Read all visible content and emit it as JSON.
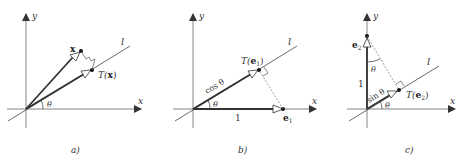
{
  "panels": [
    {
      "id": "a",
      "caption": "a)",
      "labels": {
        "x_axis": "x",
        "y_axis": "y",
        "line": "l",
        "angle": "θ",
        "vector": "x",
        "image_prefix": "T(",
        "image_arg": "x",
        "image_suffix": ")"
      }
    },
    {
      "id": "b",
      "caption": "b)",
      "labels": {
        "x_axis": "x",
        "y_axis": "y",
        "line": "l",
        "angle": "θ",
        "proj_length": "cos θ",
        "unit_length": "1",
        "vector": "e",
        "vector_sub": "1",
        "image_prefix": "T(",
        "image_arg": "e",
        "image_sub": "1",
        "image_suffix": ")"
      }
    },
    {
      "id": "c",
      "caption": "c)",
      "labels": {
        "x_axis": "x",
        "y_axis": "y",
        "line": "l",
        "angle": "θ",
        "angle_top": "θ",
        "proj_length": "sin θ",
        "unit_length": "1",
        "vector": "e",
        "vector_sub": "2",
        "image_prefix": "T(",
        "image_arg": "e",
        "image_sub": "2",
        "image_suffix": ")"
      }
    }
  ],
  "colors": {
    "axis": "#555555",
    "vector": "#333333",
    "dashed": "#888888",
    "background": "#ffffff"
  }
}
